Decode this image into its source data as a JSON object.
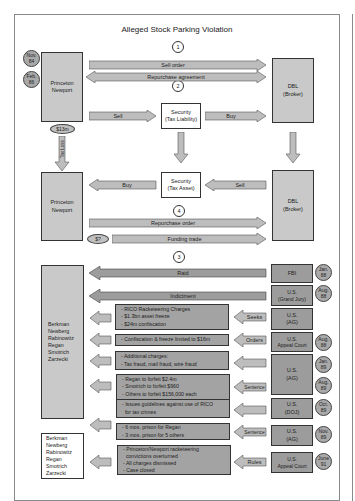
{
  "diagram": {
    "title": "Alleged Stock Parking Violation",
    "step_numbers": [
      "1",
      "2",
      "4",
      "3"
    ],
    "entities": {
      "princeton_newport_top": "Princeton\nNewport",
      "dbl_top": "DBL\n(Broker)",
      "security_tax_liability": "Security\n(Tax Liability)",
      "princeton_newport_mid": "Princeton\nNewport",
      "dbl_mid": "DBL\n(Broker)",
      "security_tax_asset": "Security\n(Tax Asset)",
      "defendants_group": [
        "Berkman",
        "Newberg",
        "Rabinowitz",
        "Regan",
        "Smotrich",
        "Zarzecki"
      ],
      "defendants_final": [
        "Berkman",
        "Newberg",
        "Rabinowitz",
        "Regan",
        "Smotrich",
        "Zarzecki"
      ]
    },
    "top_dates": [
      "Nov.\n84",
      "Feb.\n86"
    ],
    "money_ovals": [
      "$13m",
      "$?"
    ],
    "arrows": {
      "sell_order": "Sell order",
      "repurchase_agreement": "Repurchase agreement",
      "sell_1": "Sell",
      "buy_1": "Buy",
      "tax_loss": "Tax Loss",
      "buy_2": "Buy",
      "sell_2": "Sell",
      "repurchase_order": "Repurchase order",
      "funding_trade": "Funding trade",
      "raid": "Raid",
      "indictment": "Indictment",
      "seeks": "Seeks",
      "orders": "Orders",
      "sentence_1": "Sentence",
      "sentence_2": "Sentence",
      "rules": "Rules"
    },
    "agencies": [
      {
        "label": "FBI",
        "date": "Jan.\n88"
      },
      {
        "label": "U.S.\n(Grand Jury)",
        "date": "Aug.\n88"
      },
      {
        "label": "U.S.\n(AG)",
        "date": ""
      },
      {
        "label": "U.S.\nAppeal Court",
        "date": "Aug.\n88"
      },
      {
        "label": "U.S.\n(AG)",
        "dates": [
          "Jan.\n89",
          "Aug.\n89"
        ]
      },
      {
        "label": "U.S.\n(DOJ)",
        "date": "Oct.\n89"
      },
      {
        "label": "U.S.\n(AG)",
        "date": "Nov.\n89"
      },
      {
        "label": "U.S.\nAppeal Court",
        "date": "June\n91"
      }
    ],
    "notes": [
      [
        "- RICO Racketeering Charges",
        "- $1.3bn asset freeze",
        "- $24m confiscation"
      ],
      [
        "- Confiscation & freeze limited to $16m"
      ],
      [
        "- Additional charges:",
        "- Tax fraud, mail fraud, wire fraud"
      ],
      [
        "- Regan to forfeit $2.4m",
        "- Smotrich to forfeit $960",
        "- Others to forfeit $156,000 each"
      ],
      [
        "- Issues guidelines against use of RICO",
        "  for tax crimes"
      ],
      [
        "- 6 mos. prison for Regan",
        "- 3 mos. prison for 5 others"
      ],
      [
        "- Princeton/Newport racketeering",
        "  convictions overturned",
        "- All charges dismissed",
        "- Case closed"
      ]
    ]
  },
  "colors": {
    "light_box": "#c9c9c9",
    "dark_box": "#9c9c9c",
    "note_box": "#a3a3a3",
    "arrow_fill": "#bdbdbd",
    "date_circle": "#a9a9a9",
    "border": "#333333"
  }
}
